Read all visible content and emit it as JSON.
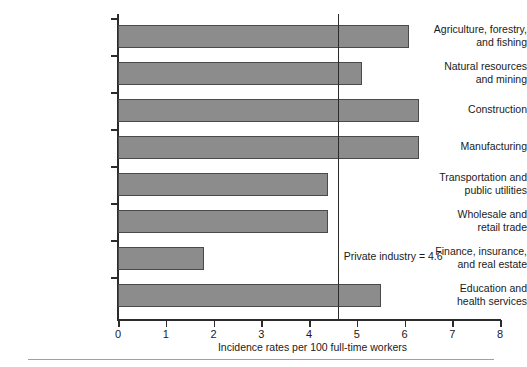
{
  "chart_data": {
    "type": "bar",
    "orientation": "horizontal",
    "title": "",
    "xlabel": "Incidence rates per 100 full-time workers",
    "ylabel": "",
    "xlim": [
      0,
      8
    ],
    "xticks": [
      0,
      1,
      2,
      3,
      4,
      5,
      6,
      7,
      8
    ],
    "xtick_labels": [
      "0",
      "1",
      "2",
      "3",
      "4",
      "5",
      "6",
      "7",
      "8"
    ],
    "grid": false,
    "legend": false,
    "categories": [
      "Agriculture, forestry,\nand fishing",
      "Natural resources\nand mining",
      "Construction",
      "Manufacturing",
      "Transportation and\npublic utilities",
      "Wholesale and\nretail trade",
      "Finance, insurance,\nand real estate",
      "Education and\nhealth services"
    ],
    "values": [
      6.1,
      5.1,
      6.3,
      6.3,
      4.4,
      4.4,
      1.8,
      5.5
    ],
    "bar_color": "#8c8c8c",
    "bar_edge_color": "#4a4a4a",
    "axis_color": "#2b2b2b",
    "reference_line": {
      "value": 4.6,
      "label": "Private industry = 4.6",
      "color": "#2b2b2b"
    }
  }
}
